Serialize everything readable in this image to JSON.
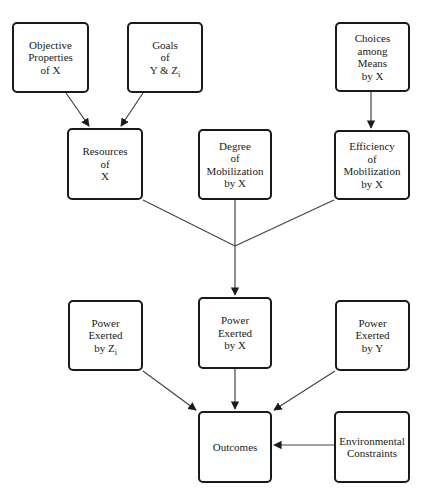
{
  "diagram": {
    "nodes": [
      {
        "id": "objective_properties",
        "lines": [
          "Objective",
          "Properties",
          "of  X"
        ]
      },
      {
        "id": "goals",
        "lines": [
          "Goals",
          "of",
          "Y &  Z"
        ],
        "subscript": "i"
      },
      {
        "id": "choices_among_means",
        "lines": [
          "Choices",
          "among",
          "Means",
          "by  X"
        ]
      },
      {
        "id": "resources",
        "lines": [
          "Resources",
          "of",
          "X"
        ]
      },
      {
        "id": "degree_mobilization",
        "lines": [
          "Degree",
          "of",
          "Mobilization",
          "by  X"
        ]
      },
      {
        "id": "efficiency_mobilization",
        "lines": [
          "Efficiency",
          "of",
          "Mobilization",
          "by  X"
        ]
      },
      {
        "id": "power_z",
        "lines": [
          "Power",
          "Exerted",
          "by  Z"
        ],
        "subscript": "i"
      },
      {
        "id": "power_x",
        "lines": [
          "Power",
          "Exerted",
          "by  X"
        ]
      },
      {
        "id": "power_y",
        "lines": [
          "Power",
          "Exerted",
          "by  Y"
        ]
      },
      {
        "id": "outcomes",
        "lines": [
          "Outcomes"
        ]
      },
      {
        "id": "environmental_constraints",
        "lines": [
          "Environmental",
          "Constraints"
        ]
      }
    ],
    "edges": [
      {
        "from": "objective_properties",
        "to": "resources"
      },
      {
        "from": "goals",
        "to": "resources"
      },
      {
        "from": "choices_among_means",
        "to": "efficiency_mobilization"
      },
      {
        "from": "resources",
        "to": "junction"
      },
      {
        "from": "degree_mobilization",
        "to": "junction"
      },
      {
        "from": "efficiency_mobilization",
        "to": "junction"
      },
      {
        "from": "junction",
        "to": "power_x"
      },
      {
        "from": "power_z",
        "to": "outcomes"
      },
      {
        "from": "power_x",
        "to": "outcomes"
      },
      {
        "from": "power_y",
        "to": "outcomes"
      },
      {
        "from": "environmental_constraints",
        "to": "outcomes"
      }
    ],
    "colors": {
      "stroke": "#1a1a1a",
      "line": "#444444",
      "background": "#ffffff"
    }
  }
}
